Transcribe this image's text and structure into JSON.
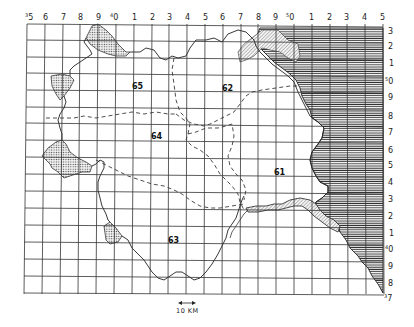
{
  "map": {
    "top_axis_labels": [
      {
        "sup": "3",
        "label": "5"
      },
      {
        "sup": "",
        "label": "6"
      },
      {
        "sup": "",
        "label": "7"
      },
      {
        "sup": "",
        "label": "8"
      },
      {
        "sup": "",
        "label": "9"
      },
      {
        "sup": "4",
        "label": "0"
      },
      {
        "sup": "",
        "label": "1"
      },
      {
        "sup": "",
        "label": "2"
      },
      {
        "sup": "",
        "label": "3"
      },
      {
        "sup": "",
        "label": "4"
      },
      {
        "sup": "",
        "label": "5"
      },
      {
        "sup": "",
        "label": "6"
      },
      {
        "sup": "",
        "label": "7"
      },
      {
        "sup": "",
        "label": "8"
      },
      {
        "sup": "",
        "label": "9"
      },
      {
        "sup": "5",
        "label": "0"
      },
      {
        "sup": "",
        "label": "1"
      },
      {
        "sup": "",
        "label": "2"
      },
      {
        "sup": "",
        "label": "3"
      },
      {
        "sup": "",
        "label": "4"
      },
      {
        "sup": "",
        "label": "5"
      }
    ],
    "right_axis_labels": [
      {
        "sup": "",
        "label": "3"
      },
      {
        "sup": "",
        "label": "2"
      },
      {
        "sup": "",
        "label": "1"
      },
      {
        "sup": "5",
        "label": "0"
      },
      {
        "sup": "",
        "label": "9"
      },
      {
        "sup": "",
        "label": "8"
      },
      {
        "sup": "",
        "label": "7"
      },
      {
        "sup": "",
        "label": "6"
      },
      {
        "sup": "",
        "label": "5"
      },
      {
        "sup": "",
        "label": "4"
      },
      {
        "sup": "",
        "label": "3"
      },
      {
        "sup": "",
        "label": "2"
      },
      {
        "sup": "",
        "label": "1"
      },
      {
        "sup": "4",
        "label": "0"
      },
      {
        "sup": "",
        "label": "9"
      },
      {
        "sup": "",
        "label": "8"
      },
      {
        "sup": "3",
        "label": "7"
      }
    ],
    "region_labels": {
      "r61": "61",
      "r62": "62",
      "r63": "63",
      "r64": "64",
      "r65": "65"
    },
    "scale_bar": {
      "label": "10 KM"
    },
    "legend_colors": {
      "grid": "#333333",
      "boundary": "#222222",
      "sea_hatch": "#444444",
      "stipple": "#555555"
    }
  }
}
